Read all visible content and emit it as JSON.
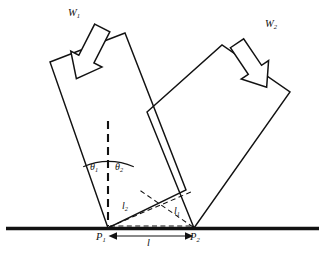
{
  "figure": {
    "kind": "mechanics-free-body-diagram",
    "background_color": "#ffffff",
    "line_color": "#121212"
  },
  "labels": {
    "weight_1": {
      "text": "W",
      "sub": "1"
    },
    "weight_2": {
      "text": "W",
      "sub": "2"
    },
    "theta_1": {
      "text": "θ",
      "sub": "1"
    },
    "theta_2": {
      "text": "θ",
      "sub": "2"
    },
    "length_1": {
      "text": "l",
      "sub": "1"
    },
    "length_2": {
      "text": "l",
      "sub": "2"
    },
    "point_1": {
      "text": "P",
      "sub": "1"
    },
    "point_2": {
      "text": "P",
      "sub": "2"
    },
    "span": {
      "text": "l",
      "sub": ""
    }
  },
  "geometry": {
    "ground_line": {
      "y": 228,
      "x_start": 6,
      "x_end": 319,
      "stroke_width": 3.2
    },
    "contact_point_1": {
      "x": 108,
      "y": 228
    },
    "contact_point_2": {
      "x": 194,
      "y": 228
    },
    "block_left": {
      "vertices": [
        [
          50,
          62
        ],
        [
          125,
          33
        ],
        [
          186,
          190
        ],
        [
          108,
          228
        ]
      ],
      "note": "left block, wedge converging at P1"
    },
    "block_right": {
      "vertices": [
        [
          147,
          112
        ],
        [
          222,
          45
        ],
        [
          290,
          92
        ],
        [
          194,
          228
        ]
      ],
      "note": "right block, wedge converging at P2"
    },
    "plumb_line": {
      "x": 108,
      "y_top": 121,
      "y_bottom": 226,
      "style": "dashed"
    },
    "angle_arc": {
      "center": [
        108,
        228
      ],
      "radius": 66,
      "start_deg": 248,
      "end_deg": 292
    },
    "dashed_l2": {
      "from": [
        108,
        228
      ],
      "to": [
        190,
        193
      ]
    },
    "dashed_l1": {
      "from": [
        194,
        228
      ],
      "to": [
        139,
        190
      ]
    },
    "dashed_base": {
      "from": [
        108,
        228
      ],
      "to": [
        194,
        228
      ]
    },
    "dimension_line": {
      "y": 236,
      "x_start": 111,
      "x_end": 191
    },
    "arrow_w1": {
      "tail": [
        67,
        27
      ],
      "head": [
        112,
        77
      ],
      "angle_deg": 27,
      "style": "hollow-block-arrow"
    },
    "arrow_w2": {
      "tail": [
        272,
        40
      ],
      "head": [
        230,
        88
      ],
      "angle_deg": -34,
      "style": "hollow-block-arrow"
    }
  },
  "label_positions": {
    "weight_1": {
      "x": 68,
      "y": 8
    },
    "weight_2": {
      "x": 265,
      "y": 19
    },
    "theta_1": {
      "x": 90,
      "y": 162
    },
    "theta_2": {
      "x": 115,
      "y": 162
    },
    "length_2": {
      "x": 122,
      "y": 201
    },
    "length_1": {
      "x": 174,
      "y": 206
    },
    "point_1": {
      "x": 96,
      "y": 232
    },
    "point_2": {
      "x": 190,
      "y": 232
    },
    "span": {
      "x": 147,
      "y": 238
    }
  }
}
